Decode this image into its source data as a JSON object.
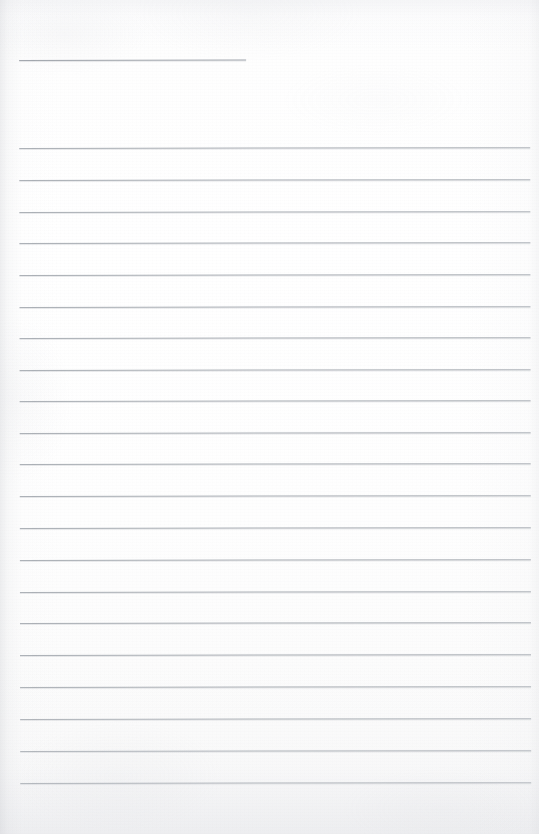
{
  "document": {
    "kind": "scanned-lined-notebook-page",
    "title": "",
    "page_width": 539,
    "page_height": 834,
    "background_color": "#fdfdfd",
    "rule_color": "#a9aeb4",
    "edge_shadow_color": "#c6c8cd",
    "text_content": "",
    "visible_text": []
  },
  "rules": {
    "left_margin_x": 19,
    "right_margin_x": 530,
    "line_spacing": 31.75,
    "header_rule": {
      "label": "header-rule",
      "x": 19,
      "y": 60,
      "width": 227
    },
    "body_rules": [
      {
        "label": "rule-1",
        "y": 148
      },
      {
        "label": "rule-2",
        "y": 180
      },
      {
        "label": "rule-3",
        "y": 212
      },
      {
        "label": "rule-4",
        "y": 243
      },
      {
        "label": "rule-5",
        "y": 275
      },
      {
        "label": "rule-6",
        "y": 307
      },
      {
        "label": "rule-7",
        "y": 338
      },
      {
        "label": "rule-8",
        "y": 370
      },
      {
        "label": "rule-9",
        "y": 401
      },
      {
        "label": "rule-10",
        "y": 433
      },
      {
        "label": "rule-11",
        "y": 464
      },
      {
        "label": "rule-12",
        "y": 496
      },
      {
        "label": "rule-13",
        "y": 528
      },
      {
        "label": "rule-14",
        "y": 560
      },
      {
        "label": "rule-15",
        "y": 592
      },
      {
        "label": "rule-16",
        "y": 623
      },
      {
        "label": "rule-17",
        "y": 655
      },
      {
        "label": "rule-18",
        "y": 687
      },
      {
        "label": "rule-19",
        "y": 719
      },
      {
        "label": "rule-20",
        "y": 751
      },
      {
        "label": "rule-21",
        "y": 783
      }
    ]
  }
}
